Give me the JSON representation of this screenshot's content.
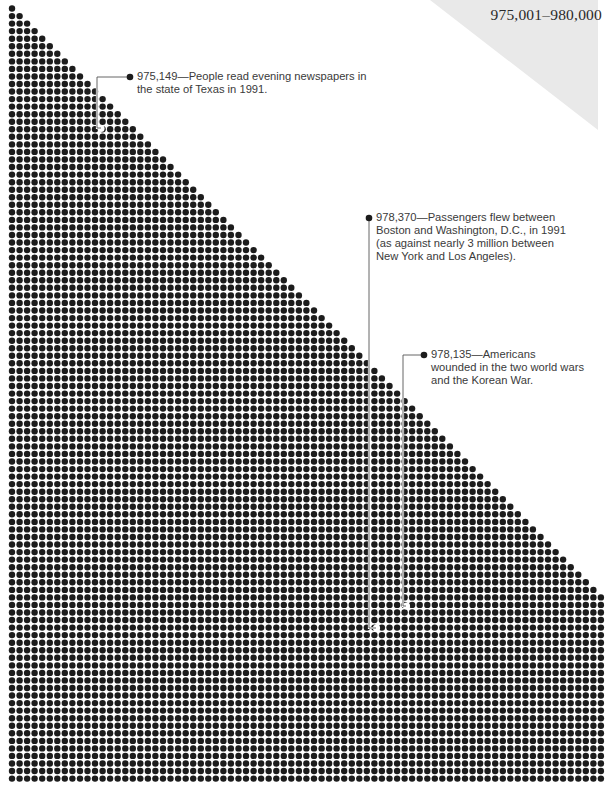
{
  "title": "975,001–980,000",
  "colors": {
    "dot": "#1c1c1c",
    "background": "#ffffff",
    "corner_shade": "#e9e9e9",
    "leader": "#555555",
    "text": "#3a3a3a"
  },
  "grid": {
    "start_x": 12,
    "start_y": 8.5,
    "pitch": 7.55,
    "dot_radius": 3.2,
    "rows": 103,
    "max_cols": 79
  },
  "annotations": [
    {
      "value": "975,149",
      "lines": [
        "975,149—People read evening newspapers in",
        "the state of Texas in 1991."
      ],
      "bullet": [
        130,
        77
      ],
      "text_pos": [
        137,
        70
      ],
      "leader": [
        [
          130,
          77
        ],
        [
          97,
          77
        ],
        [
          97,
          128
        ],
        [
          101,
          128
        ]
      ],
      "hole": [
        101,
        128.5
      ]
    },
    {
      "value": "978,370",
      "lines": [
        "978,370—Passengers flew between",
        "Boston and Washington, D.C.,  in 1991",
        "(as against nearly 3 million between",
        "New York and Los Angeles)."
      ],
      "bullet": [
        369,
        218
      ],
      "text_pos": [
        376,
        211
      ],
      "leader": [
        [
          369,
          218
        ],
        [
          369,
          628
        ],
        [
          376,
          628
        ]
      ],
      "hole": [
        376.5,
        628
      ]
    },
    {
      "value": "978,135",
      "lines": [
        "978,135—Americans",
        "wounded in the two world wars",
        "and the Korean War."
      ],
      "bullet": [
        424,
        355
      ],
      "text_pos": [
        431,
        348
      ],
      "leader": [
        [
          424,
          355
        ],
        [
          403,
          355
        ],
        [
          403,
          606
        ],
        [
          406,
          606
        ]
      ],
      "hole": [
        406.5,
        606
      ]
    }
  ]
}
